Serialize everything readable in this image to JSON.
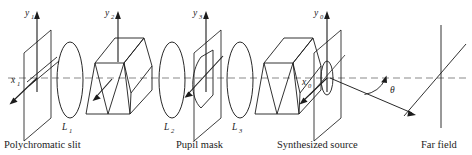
{
  "figure": {
    "kind": "optical-system-schematic",
    "title": "",
    "stroke_color": "#1c1c1c",
    "axis_dash_color": "#8a8a8a",
    "background": "#ffffff"
  },
  "axes": [
    {
      "id": "y1",
      "base": "y",
      "sub": "1",
      "orientation": "vertical-up"
    },
    {
      "id": "x1",
      "base": "x",
      "sub": "1",
      "orientation": "oblique-down-left"
    },
    {
      "id": "y2",
      "base": "y",
      "sub": "2",
      "orientation": "vertical-up"
    },
    {
      "id": "y3",
      "base": "y",
      "sub": "3",
      "orientation": "vertical-up"
    },
    {
      "id": "y0",
      "base": "y",
      "sub": "0",
      "orientation": "vertical-up"
    },
    {
      "id": "x0",
      "base": "x",
      "sub": "0",
      "orientation": "oblique-down-left"
    }
  ],
  "lenses": [
    {
      "id": "L1",
      "base": "L",
      "sub": "1"
    },
    {
      "id": "L2",
      "base": "L",
      "sub": "2"
    },
    {
      "id": "L3",
      "base": "L",
      "sub": "3"
    }
  ],
  "angle": {
    "symbol": "θ",
    "name": "theta"
  },
  "captions": [
    {
      "id": "polychromatic-slit",
      "text": "Polychromatic slit"
    },
    {
      "id": "pupil-mask",
      "text": "Pupil mask"
    },
    {
      "id": "synthesized-source",
      "text": "Synthesized source"
    },
    {
      "id": "far-field",
      "text": "Far field"
    }
  ],
  "components": [
    {
      "id": "slit-plane",
      "label": "Polychromatic slit"
    },
    {
      "id": "lens-1",
      "label": "L1"
    },
    {
      "id": "prism-pair-1",
      "label": "dispersing prism assembly"
    },
    {
      "id": "lens-2",
      "label": "L2"
    },
    {
      "id": "pupil-mask-plane",
      "label": "Pupil mask"
    },
    {
      "id": "lens-3",
      "label": "L3"
    },
    {
      "id": "prism-pair-2",
      "label": "recombining prism assembly"
    },
    {
      "id": "synthesized-source-plane",
      "label": "Synthesized source"
    },
    {
      "id": "far-field-plane",
      "label": "Far field"
    }
  ]
}
